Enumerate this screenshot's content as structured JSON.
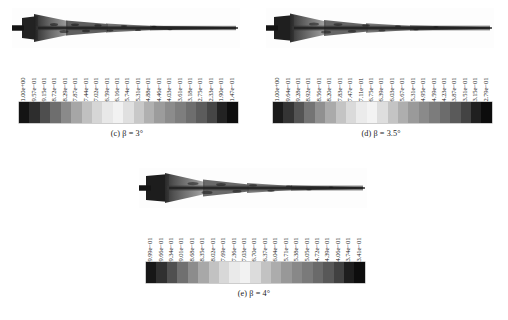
{
  "figure": {
    "kind": "cfd-contour-panels",
    "colorbar_orientation": "horizontal",
    "label_rotation_deg": -90,
    "panels": [
      {
        "id": "c",
        "caption_index": "(c)",
        "caption_symbol": "β",
        "caption_eq": "=",
        "caption_value": "3°",
        "caption_full": "(c) β = 3°",
        "tick_labels": [
          "1.00e+00",
          "9.57e−01",
          "9.15e−01",
          "8.72e−01",
          "8.29e−01",
          "7.87e−01",
          "7.44e−01",
          "7.02e−01",
          "6.59e−01",
          "6.16e−01",
          "5.74e−01",
          "5.31e−01",
          "4.88e−01",
          "4.46e−01",
          "4.03e−01",
          "3.61e−01",
          "3.18e−01",
          "2.75e−01",
          "2.33e−01",
          "1.90e−01",
          "1.47e−01"
        ]
      },
      {
        "id": "d",
        "caption_index": "(d)",
        "caption_symbol": "β",
        "caption_eq": "=",
        "caption_value": "3.5°",
        "caption_full": "(d) β = 3.5°",
        "tick_labels": [
          "1.00e+00",
          "9.64e−01",
          "9.28e−01",
          "8.92e−01",
          "8.56e−01",
          "8.20e−01",
          "7.83e−01",
          "7.47e−01",
          "7.11e−01",
          "6.75e−01",
          "6.39e−01",
          "6.03e−01",
          "5.67e−01",
          "5.31e−01",
          "4.95e−01",
          "4.59e−01",
          "4.23e−01",
          "3.87e−01",
          "3.51e−01",
          "3.15e−01",
          "2.79e−01"
        ]
      },
      {
        "id": "e",
        "caption_index": "(e)",
        "caption_symbol": "β",
        "caption_eq": "=",
        "caption_value": "4°",
        "caption_full": "(e) β = 4°",
        "tick_labels": [
          "9.99e−01",
          "9.66e−01",
          "9.34e−01",
          "9.01e−01",
          "8.68e−01",
          "8.35e−01",
          "8.02e−01",
          "7.69e−01",
          "7.36e−01",
          "7.03e−01",
          "6.70e−01",
          "6.37e−01",
          "6.04e−01",
          "5.71e−01",
          "5.38e−01",
          "5.05e−01",
          "4.72e−01",
          "4.39e−01",
          "4.06e−01",
          "3.74e−01",
          "3.41e−01"
        ]
      }
    ]
  },
  "chart_data": {
    "type": "heatmap",
    "title": "",
    "xlabel": "",
    "ylabel": "",
    "grid": false,
    "legend_position": "below-plot",
    "colormap": "grayscale-banded",
    "panels": [
      {
        "name": "(c) β = 3°",
        "cbar_max": 1.0,
        "cbar_min": 0.147,
        "n_bands": 21,
        "values": [
          1.0,
          0.957,
          0.915,
          0.872,
          0.829,
          0.787,
          0.744,
          0.702,
          0.659,
          0.616,
          0.574,
          0.531,
          0.488,
          0.446,
          0.403,
          0.361,
          0.318,
          0.275,
          0.233,
          0.19,
          0.147
        ],
        "band_grays": [
          "#141414",
          "#2d2d2d",
          "#4e4e4e",
          "#6e6e6e",
          "#8a8a8a",
          "#a6a6a6",
          "#c0c0c0",
          "#d6d6d6",
          "#e8e8e8",
          "#f2f2f2",
          "#e0e0e0",
          "#c8c8c8",
          "#b0b0b0",
          "#9c9c9c",
          "#8c8c8c",
          "#7e7e7e",
          "#6e6e6e",
          "#5c5c5c",
          "#464646",
          "#232323",
          "#0e0e0e"
        ]
      },
      {
        "name": "(d) β = 3.5°",
        "cbar_max": 1.0,
        "cbar_min": 0.279,
        "n_bands": 21,
        "values": [
          1.0,
          0.964,
          0.928,
          0.892,
          0.856,
          0.82,
          0.783,
          0.747,
          0.711,
          0.675,
          0.639,
          0.603,
          0.567,
          0.531,
          0.495,
          0.459,
          0.423,
          0.387,
          0.351,
          0.315,
          0.279
        ],
        "band_grays": [
          "#1a1a1a",
          "#343434",
          "#545454",
          "#747474",
          "#909090",
          "#aaaaaa",
          "#c4c4c4",
          "#dadada",
          "#ebebeb",
          "#f3f3f3",
          "#dedede",
          "#c4c4c4",
          "#aeaeae",
          "#9a9a9a",
          "#8a8a8a",
          "#7c7c7c",
          "#6c6c6c",
          "#5a5a5a",
          "#434343",
          "#202020",
          "#0c0c0c"
        ]
      },
      {
        "name": "(e) β = 4°",
        "cbar_max": 0.999,
        "cbar_min": 0.341,
        "n_bands": 21,
        "values": [
          0.999,
          0.966,
          0.934,
          0.901,
          0.868,
          0.835,
          0.802,
          0.769,
          0.736,
          0.703,
          0.67,
          0.637,
          0.604,
          0.571,
          0.538,
          0.505,
          0.472,
          0.439,
          0.406,
          0.374,
          0.341
        ],
        "band_grays": [
          "#171717",
          "#303030",
          "#505050",
          "#707070",
          "#8c8c8c",
          "#a8a8a8",
          "#c2c2c2",
          "#d8d8d8",
          "#eaeaea",
          "#f2f2f2",
          "#dcdcdc",
          "#c2c2c2",
          "#acacac",
          "#989898",
          "#888888",
          "#7a7a7a",
          "#6a6a6a",
          "#585858",
          "#414141",
          "#1e1e1e",
          "#0d0d0d"
        ]
      }
    ]
  }
}
